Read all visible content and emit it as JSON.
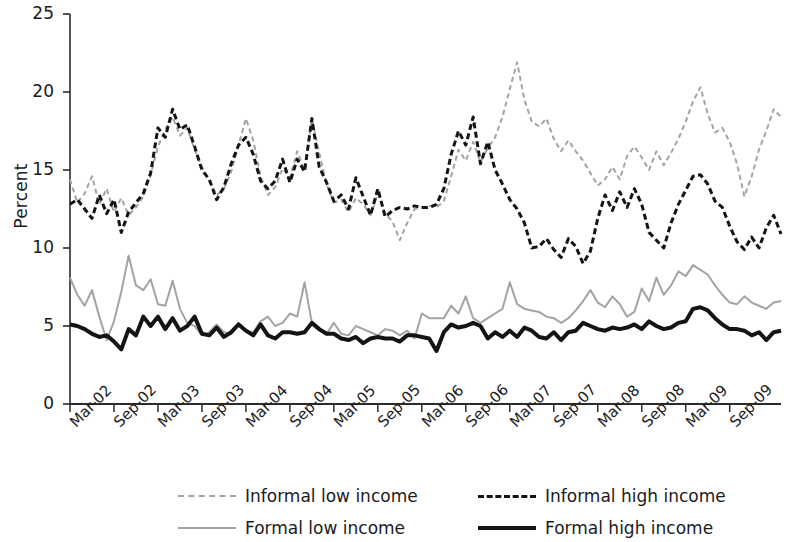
{
  "chart_data": {
    "type": "line",
    "title": "",
    "xlabel": "",
    "ylabel": "Percent",
    "ylim": [
      0,
      25
    ],
    "yticks": [
      0,
      5,
      10,
      15,
      20,
      25
    ],
    "grid": false,
    "legend_position": "bottom",
    "x_tick_labels": [
      "Mar-02",
      "Sep-02",
      "Mar-03",
      "Sep-03",
      "Mar-04",
      "Sep-04",
      "Mar-05",
      "Sep-05",
      "Mar-06",
      "Sep-06",
      "Mar-07",
      "Sep-07",
      "Mar-08",
      "Sep-08",
      "Mar-09",
      "Sep-09"
    ],
    "x_tick_step_months": 6,
    "x_start": "Mar-02",
    "x_end": "Dec-09",
    "n_points": 94,
    "series": [
      {
        "name": "Informal low income",
        "style": "dashed",
        "color": "#a3a3a3",
        "width": 2,
        "values": [
          14.4,
          12.9,
          13.5,
          14.6,
          12.8,
          13.8,
          12.3,
          13.2,
          12.1,
          12.6,
          13.3,
          14.7,
          16.5,
          17.6,
          18.4,
          17.2,
          17.7,
          16.3,
          15.2,
          14.3,
          13.4,
          13.8,
          14.9,
          16.6,
          18.3,
          16.9,
          14.6,
          13.4,
          13.9,
          15.1,
          14.5,
          16.2,
          15.0,
          18.3,
          16.1,
          14.1,
          12.9,
          13.1,
          12.3,
          13.2,
          12.8,
          12.1,
          13.5,
          12.2,
          11.7,
          10.5,
          11.6,
          12.5,
          12.6,
          12.7,
          12.6,
          13.0,
          14.6,
          16.3,
          15.6,
          16.8,
          15.5,
          16.4,
          17.1,
          18.4,
          20.2,
          21.9,
          19.5,
          18.1,
          17.8,
          18.3,
          17.0,
          16.2,
          16.9,
          16.2,
          15.6,
          14.8,
          14.0,
          14.4,
          15.2,
          14.4,
          15.9,
          16.5,
          15.8,
          15.0,
          16.2,
          15.3,
          16.1,
          17.0,
          18.1,
          19.4,
          20.3,
          18.6,
          17.4,
          17.7,
          16.8,
          15.4,
          13.3,
          14.6,
          16.3,
          17.5,
          18.9,
          18.4
        ]
      },
      {
        "name": "Informal high income",
        "style": "dashed",
        "color": "#141414",
        "width": 3,
        "values": [
          12.8,
          13.1,
          12.5,
          11.9,
          13.4,
          12.2,
          13.1,
          11.0,
          12.3,
          12.9,
          13.5,
          14.8,
          17.7,
          17.1,
          18.9,
          17.6,
          17.9,
          16.5,
          15.0,
          14.4,
          13.1,
          13.9,
          15.4,
          16.6,
          17.1,
          16.0,
          14.3,
          13.8,
          14.3,
          15.7,
          14.2,
          15.7,
          14.9,
          18.3,
          15.2,
          14.2,
          13.0,
          13.4,
          12.5,
          14.5,
          13.3,
          12.1,
          13.8,
          12.0,
          12.4,
          12.6,
          12.5,
          12.7,
          12.6,
          12.6,
          12.8,
          13.8,
          16.0,
          17.5,
          16.6,
          18.4,
          15.4,
          16.8,
          15.0,
          14.1,
          13.1,
          12.5,
          11.6,
          10.0,
          10.1,
          10.6,
          9.9,
          9.4,
          10.6,
          10.1,
          9.0,
          9.8,
          11.9,
          13.4,
          12.4,
          13.6,
          12.6,
          13.8,
          12.8,
          11.0,
          10.5,
          10.0,
          11.6,
          12.8,
          13.7,
          14.6,
          14.7,
          14.1,
          13.0,
          12.6,
          11.4,
          10.4,
          9.9,
          10.7,
          10.0,
          11.3,
          12.1,
          10.9
        ]
      },
      {
        "name": "Formal low income",
        "style": "solid",
        "color": "#a3a3a3",
        "width": 2,
        "values": [
          8.1,
          7.0,
          6.3,
          7.3,
          5.6,
          4.1,
          5.3,
          7.2,
          9.5,
          7.6,
          7.3,
          8.0,
          6.4,
          6.3,
          7.9,
          6.1,
          5.2,
          5.0,
          4.4,
          4.6,
          5.1,
          4.6,
          4.5,
          5.2,
          4.7,
          4.6,
          5.3,
          5.6,
          5.0,
          5.2,
          5.8,
          5.6,
          7.8,
          5.2,
          4.7,
          4.5,
          5.2,
          4.5,
          4.4,
          5.0,
          4.8,
          4.6,
          4.4,
          4.8,
          4.7,
          4.4,
          4.7,
          4.2,
          5.8,
          5.5,
          5.5,
          5.5,
          6.3,
          5.8,
          6.9,
          5.5,
          5.2,
          5.5,
          5.8,
          6.1,
          7.8,
          6.4,
          6.1,
          6.0,
          5.9,
          5.6,
          5.5,
          5.2,
          5.5,
          6.0,
          6.6,
          7.3,
          6.5,
          6.2,
          6.9,
          6.4,
          5.6,
          5.9,
          7.4,
          6.6,
          8.1,
          7.0,
          7.6,
          8.5,
          8.2,
          8.9,
          8.6,
          8.3,
          7.6,
          7.0,
          6.5,
          6.4,
          6.9,
          6.5,
          6.3,
          6.1,
          6.5,
          6.6
        ]
      },
      {
        "name": "Formal high income",
        "style": "solid",
        "color": "#141414",
        "width": 4,
        "values": [
          5.1,
          5.0,
          4.8,
          4.5,
          4.3,
          4.4,
          4.0,
          3.5,
          4.8,
          4.4,
          5.6,
          5.0,
          5.6,
          4.8,
          5.5,
          4.7,
          5.0,
          5.6,
          4.5,
          4.4,
          4.9,
          4.3,
          4.6,
          5.1,
          4.7,
          4.4,
          5.1,
          4.4,
          4.2,
          4.6,
          4.6,
          4.5,
          4.6,
          5.2,
          4.8,
          4.5,
          4.5,
          4.2,
          4.1,
          4.3,
          3.9,
          4.2,
          4.3,
          4.2,
          4.2,
          4.0,
          4.4,
          4.4,
          4.3,
          4.2,
          3.4,
          4.6,
          5.1,
          4.9,
          5.0,
          5.2,
          5.0,
          4.2,
          4.6,
          4.3,
          4.7,
          4.3,
          4.9,
          4.7,
          4.3,
          4.2,
          4.6,
          4.1,
          4.6,
          4.7,
          5.2,
          5.0,
          4.8,
          4.7,
          4.9,
          4.8,
          4.9,
          5.1,
          4.8,
          5.3,
          5.0,
          4.8,
          4.9,
          5.2,
          5.3,
          6.1,
          6.2,
          6.0,
          5.5,
          5.1,
          4.8,
          4.8,
          4.7,
          4.4,
          4.6,
          4.1,
          4.6,
          4.7
        ]
      }
    ]
  },
  "axis": {
    "y_title": "Percent"
  },
  "legend": {
    "items": [
      {
        "label": "Informal low income",
        "swatch": "dashed-light-line-swatch"
      },
      {
        "label": "Informal high income",
        "swatch": "dashed-dark-line-swatch"
      },
      {
        "label": "Formal low income",
        "swatch": "solid-light-line-swatch"
      },
      {
        "label": "Formal high income",
        "swatch": "solid-dark-line-swatch"
      }
    ]
  }
}
